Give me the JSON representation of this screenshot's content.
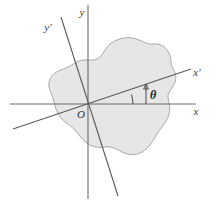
{
  "figure": {
    "kind": "rotated-axes-diagram",
    "background_color": "#ffffff",
    "width": 218,
    "height": 205
  },
  "region": {
    "name": "shaded-region",
    "fill_color": "#e6e6e6",
    "stroke_color": "#a9a9a9",
    "description": "irregular closed blob region"
  },
  "origin": {
    "label": "O",
    "x": 88,
    "y": 104
  },
  "axes": {
    "original": [
      {
        "id": "x-axis",
        "label": "x",
        "label_x": 198,
        "label_y": 115,
        "color": "#6b6b6b",
        "x1": 10,
        "y1": 104,
        "x2": 196,
        "y2": 104
      },
      {
        "id": "y-axis",
        "label": "y",
        "label_x": 84,
        "label_y": 16,
        "color": "#6b6b6b",
        "x1": 88,
        "y1": 5,
        "x2": 88,
        "y2": 199
      }
    ],
    "rotated": [
      {
        "id": "x-prime-axis",
        "label": "x′",
        "label_x": 196,
        "label_y": 76,
        "color": "#5a5a5a",
        "x1": 13,
        "y1": 129,
        "x2": 191,
        "y2": 69
      },
      {
        "id": "y-prime-axis",
        "label": "y′",
        "label_x": 48,
        "label_y": 30,
        "color": "#5a5a5a",
        "x1": 61,
        "y1": 17,
        "x2": 118,
        "y2": 196
      }
    ]
  },
  "angle": {
    "symbol": "θ",
    "label_x": 150,
    "label_y": 99,
    "between": [
      "x-axis",
      "x-prime-axis"
    ],
    "tick_x": 146,
    "tick_top_y": 85,
    "tick_bottom_y": 104
  }
}
